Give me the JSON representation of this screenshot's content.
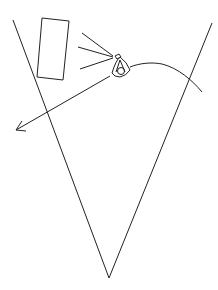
{
  "diagram": {
    "background": "#ffffff",
    "stroke_color": "#222222",
    "elements": {
      "cone": {
        "label": "",
        "apex": [
          109,
          278
        ],
        "left_top": [
          13,
          20
        ],
        "right_top": [
          212,
          23
        ]
      },
      "panel": {
        "label": "",
        "points": [
          [
            42,
            18
          ],
          [
            69,
            21
          ],
          [
            63,
            80
          ],
          [
            37,
            77
          ]
        ]
      },
      "light_rays": {
        "label": "",
        "origin": [
          113,
          58
        ],
        "ends": [
          [
            82,
            33
          ],
          [
            78,
            47
          ],
          [
            80,
            69
          ]
        ]
      },
      "eye_icon": {
        "label": ""
      },
      "curve": {
        "label": ""
      },
      "arrow": {
        "label": "",
        "from": [
          110,
          76
        ],
        "to": [
          16,
          130
        ]
      }
    }
  }
}
